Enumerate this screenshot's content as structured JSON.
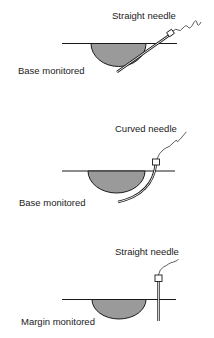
{
  "colors": {
    "line": "#1a1a1a",
    "lesion_fill": "#9a9a9a",
    "text": "#222222",
    "background": "#ffffff"
  },
  "panels": [
    {
      "needle_label": "Straight needle",
      "position_label": "Base monitored",
      "needle_type": "straight",
      "monitoring": "base"
    },
    {
      "needle_label": "Curved needle",
      "position_label": "Base monitored",
      "needle_type": "curved",
      "monitoring": "base"
    },
    {
      "needle_label": "Straight needle",
      "position_label": "Margin monitored",
      "needle_type": "straight",
      "monitoring": "margin"
    }
  ]
}
